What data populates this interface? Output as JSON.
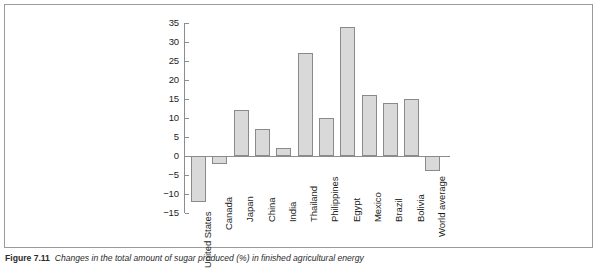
{
  "chart_data": {
    "type": "bar",
    "title": "",
    "xlabel": "",
    "ylabel": "",
    "ylim": [
      -15,
      35
    ],
    "ytick_step": 5,
    "grid": false,
    "legend": "none",
    "categories": [
      "United States",
      "Canada",
      "Japan",
      "China",
      "India",
      "Thailand",
      "Philippines",
      "Egypt",
      "Mexico",
      "Brazil",
      "Bolivia",
      "World average"
    ],
    "values": [
      -12,
      -2,
      12,
      7,
      2,
      27,
      10,
      34,
      16,
      14,
      15,
      -4
    ],
    "yticks": [
      "35",
      "30",
      "25",
      "20",
      "15",
      "10",
      "5",
      "0",
      "-5",
      "-10",
      "-15"
    ],
    "bar_fill": "#d9d9d9",
    "bar_stroke": "#8a8a8a",
    "axis_color": "#8d8d8d"
  },
  "figure": {
    "caption_label": "Figure 7.11",
    "caption_text": "Changes in the total amount of sugar produced (%) in finished agricultural energy"
  }
}
